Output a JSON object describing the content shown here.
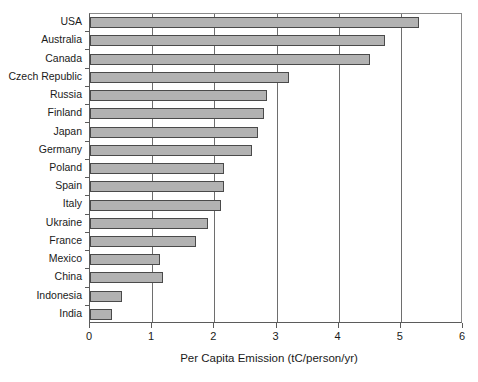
{
  "chart_data": {
    "type": "bar",
    "orientation": "horizontal",
    "title": "",
    "xlabel": "Per Capita Emission (tC/person/yr)",
    "ylabel": "",
    "xlim": [
      0,
      6
    ],
    "xticks": [
      "0",
      "1",
      "2",
      "3",
      "4",
      "5",
      "6"
    ],
    "grid": "vertical",
    "legend": "none",
    "bar_color": "#b2b2b2",
    "bar_edge_color": "#4a4a4a",
    "categories": [
      "USA",
      "Australia",
      "Canada",
      "Czech Republic",
      "Russia",
      "Finland",
      "Japan",
      "Germany",
      "Poland",
      "Spain",
      "Italy",
      "Ukraine",
      "France",
      "Mexico",
      "China",
      "Indonesia",
      "India"
    ],
    "values": [
      5.3,
      4.75,
      4.5,
      3.2,
      2.85,
      2.8,
      2.7,
      2.6,
      2.15,
      2.15,
      2.1,
      1.9,
      1.7,
      1.13,
      1.17,
      0.52,
      0.35
    ]
  }
}
